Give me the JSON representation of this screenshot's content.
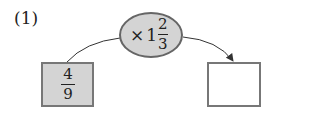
{
  "problem_label": "(1)",
  "operator": {
    "symbol": "×",
    "whole": "1",
    "numerator": "2",
    "denominator": "3"
  },
  "start_value": {
    "numerator": "4",
    "denominator": "9"
  },
  "result_value": "",
  "colors": {
    "fill_gray": "#d4d4d4",
    "stroke": "#555555",
    "box_border": "#777777",
    "text": "#222222"
  }
}
